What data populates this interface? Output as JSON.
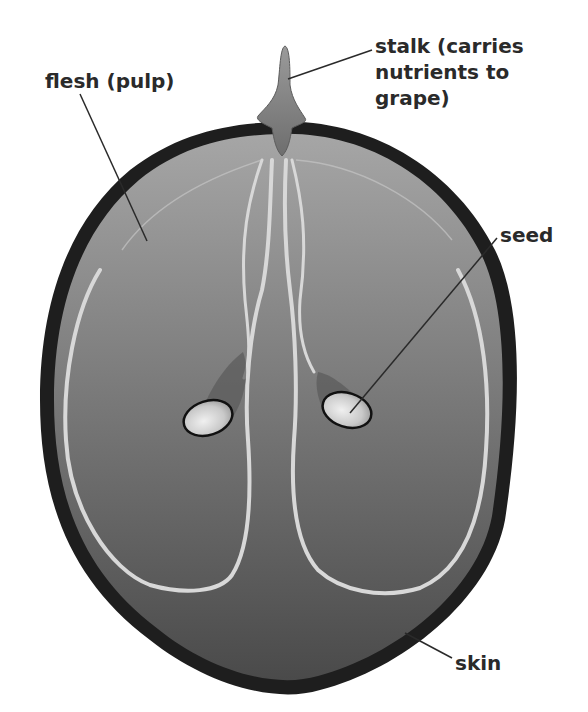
{
  "diagram": {
    "labels": {
      "stalk": "stalk (carries\nnutrients to\ngrape)",
      "flesh": "flesh (pulp)",
      "seed": "seed",
      "skin": "skin"
    },
    "colors": {
      "background": "#ffffff",
      "skin": "#1e1e1e",
      "flesh_top": "#a3a3a3",
      "flesh_bottom": "#4e4e4e",
      "vessels": "#d8d8d8",
      "seed_fill": "#e6e6e6",
      "seed_outline": "#111111",
      "stalk": "#7a7a7a",
      "label_text": "#2a2a2a",
      "leader_lines": "#2a2a2a"
    }
  }
}
